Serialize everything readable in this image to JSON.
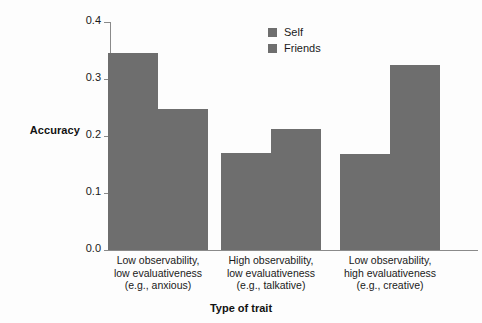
{
  "chart_data": {
    "type": "bar",
    "title": "",
    "xlabel": "Type of trait",
    "ylabel": "Accuracy",
    "ylim": [
      0.0,
      0.4
    ],
    "yticks": [
      "0.0",
      "0.1",
      "0.2",
      "0.3",
      "0.4"
    ],
    "ytick_values": [
      0.0,
      0.1,
      0.2,
      0.3,
      0.4
    ],
    "grid": false,
    "legend_position": "top-center-right",
    "categories": [
      "Low observability, low evaluativeness (e.g., anxious)",
      "High observability, low evaluativeness (e.g., talkative)",
      "Low observability, high evaluativeness (e.g., creative)"
    ],
    "category_lines": [
      [
        "Low observability,",
        "low evaluativeness",
        "(e.g., anxious)"
      ],
      [
        "High observability,",
        "low evaluativeness",
        "(e.g., talkative)"
      ],
      [
        "Low observability,",
        "high evaluativeness",
        "(e.g., creative)"
      ]
    ],
    "series": [
      {
        "name": "Self",
        "values": [
          0.345,
          0.17,
          0.168
        ]
      },
      {
        "name": "Friends",
        "values": [
          0.247,
          0.212,
          0.325
        ]
      }
    ],
    "bar_color": "#6e6e6e",
    "axis_color": "#8a8a8a",
    "background": "#fdfdfd"
  },
  "legend": {
    "items": [
      {
        "label": "Self",
        "color": "#6e6e6e"
      },
      {
        "label": "Friends",
        "color": "#6e6e6e"
      }
    ]
  }
}
